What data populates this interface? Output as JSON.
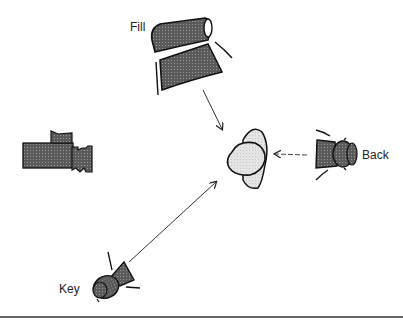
{
  "diagram": {
    "labels": {
      "fill": "Fill",
      "back": "Back",
      "key": "Key"
    },
    "elements": [
      {
        "name": "subject",
        "shape": "head-figure"
      },
      {
        "name": "camera",
        "shape": "film-camera"
      },
      {
        "name": "fill-light",
        "shape": "softbox-light",
        "label": "Fill"
      },
      {
        "name": "back-light",
        "shape": "spotlight",
        "label": "Back"
      },
      {
        "name": "key-light",
        "shape": "spotlight",
        "label": "Key"
      }
    ],
    "arrows": [
      {
        "from": "fill-light",
        "to": "subject",
        "style": "solid"
      },
      {
        "from": "back-light",
        "to": "subject",
        "style": "dashed"
      },
      {
        "from": "key-light",
        "to": "subject",
        "style": "solid"
      }
    ]
  }
}
